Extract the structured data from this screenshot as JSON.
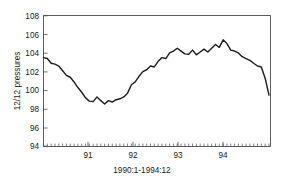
{
  "chart_data": {
    "type": "line",
    "title": "",
    "subtitle": "",
    "xlabel": "1990:1-1994:12",
    "ylabel": "12/12 pressures",
    "xlim": [
      1990.0,
      1994.95
    ],
    "ylim": [
      94,
      108
    ],
    "ytick_labels": [
      "94",
      "96",
      "98",
      "100",
      "102",
      "104",
      "106",
      "108"
    ],
    "ytick_values": [
      94,
      96,
      98,
      100,
      102,
      104,
      106,
      108
    ],
    "xtick_labels": [
      "91",
      "92",
      "93",
      "94"
    ],
    "xtick_values": [
      1991,
      1992,
      1993,
      1994
    ],
    "minor_xticks": true,
    "minor_tick_interval_months": 1,
    "grid": false,
    "legend": null,
    "series": [
      {
        "name": "12/12 pressures",
        "color": "#231f20",
        "x": [
          1990.0,
          1990.083,
          1990.167,
          1990.25,
          1990.333,
          1990.417,
          1990.5,
          1990.583,
          1990.667,
          1990.75,
          1990.833,
          1990.917,
          1991.0,
          1991.083,
          1991.167,
          1991.25,
          1991.333,
          1991.417,
          1991.5,
          1991.583,
          1991.667,
          1991.75,
          1991.833,
          1991.917,
          1992.0,
          1992.083,
          1992.167,
          1992.25,
          1992.333,
          1992.417,
          1992.5,
          1992.583,
          1992.667,
          1992.75,
          1992.833,
          1992.917,
          1993.0,
          1993.083,
          1993.167,
          1993.25,
          1993.333,
          1993.417,
          1993.5,
          1993.583,
          1993.667,
          1993.75,
          1993.833,
          1993.917,
          1994.0,
          1994.083,
          1994.167,
          1994.25,
          1994.333,
          1994.417,
          1994.5,
          1994.583,
          1994.667,
          1994.75,
          1994.833,
          1994.917
        ],
        "values": [
          103.5,
          103.4,
          102.9,
          102.8,
          102.6,
          102.1,
          101.6,
          101.4,
          100.9,
          100.3,
          99.8,
          99.2,
          98.85,
          98.8,
          99.3,
          98.9,
          98.55,
          98.9,
          98.75,
          99.0,
          99.1,
          99.3,
          99.7,
          100.6,
          100.9,
          101.5,
          102.0,
          102.2,
          102.6,
          102.5,
          103.1,
          103.5,
          103.4,
          104.0,
          104.2,
          104.5,
          104.2,
          103.9,
          103.85,
          104.3,
          103.8,
          104.1,
          104.4,
          104.1,
          104.5,
          104.9,
          104.6,
          105.4,
          105.0,
          104.3,
          104.2,
          104.0,
          103.6,
          103.4,
          103.2,
          102.9,
          102.6,
          102.5,
          101.3,
          99.5
        ]
      }
    ]
  },
  "axes": {
    "ylabel": "12/12 pressures",
    "xlabel": "1990:1-1994:12"
  }
}
